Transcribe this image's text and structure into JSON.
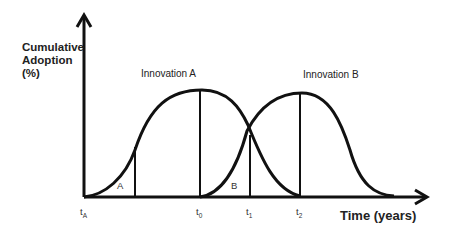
{
  "diagram": {
    "type": "overlapping-adoption-curves",
    "y_axis_label_lines": [
      "Cumulative",
      "Adoption",
      "(%)"
    ],
    "x_axis_label": "Time (years)",
    "curves": [
      {
        "name": "Innovation A",
        "label": "Innovation A"
      },
      {
        "name": "Innovation B",
        "label": "Innovation B"
      }
    ],
    "regions": [
      {
        "id": "A",
        "label": "A"
      },
      {
        "id": "B",
        "label": "B"
      }
    ],
    "x_ticks": [
      {
        "base": "t",
        "sub": "A"
      },
      {
        "base": "t",
        "sub": "0"
      },
      {
        "base": "t",
        "sub": "1"
      },
      {
        "base": "t",
        "sub": "2"
      }
    ],
    "colors": {
      "line": "#111111",
      "background": "#ffffff"
    }
  }
}
